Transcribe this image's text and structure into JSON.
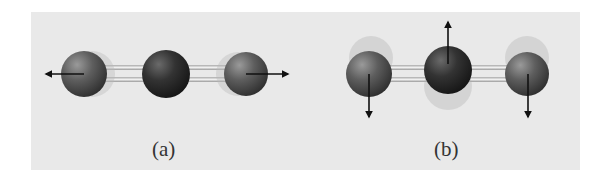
{
  "figure": {
    "panels": [
      {
        "label": "(a)",
        "mode": "symmetric stretch",
        "arrows": [
          "left",
          "right"
        ]
      },
      {
        "label": "(b)",
        "mode": "bending",
        "arrows": [
          "down",
          "up",
          "down"
        ]
      }
    ],
    "colors": {
      "background": "#e9e9e9",
      "outer_atom": "#5a5a5a",
      "center_atom": "#2f2f2f",
      "bond": "#c8c8c8",
      "arrow": "#111111"
    }
  }
}
